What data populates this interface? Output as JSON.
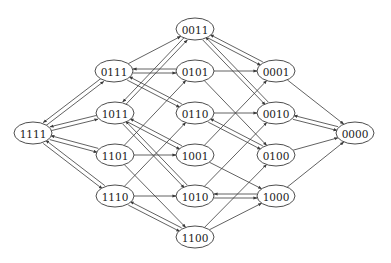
{
  "diagram": {
    "type": "directed-graph",
    "node_rx": 19,
    "node_ry": 11,
    "nodes": [
      {
        "id": "1111",
        "label": "1111",
        "x": 33,
        "y": 133
      },
      {
        "id": "0111",
        "label": "0111",
        "x": 114,
        "y": 71
      },
      {
        "id": "1011",
        "label": "1011",
        "x": 115,
        "y": 113
      },
      {
        "id": "1101",
        "label": "1101",
        "x": 115,
        "y": 155
      },
      {
        "id": "1110",
        "label": "1110",
        "x": 115,
        "y": 196
      },
      {
        "id": "0011",
        "label": "0011",
        "x": 195,
        "y": 29
      },
      {
        "id": "0101",
        "label": "0101",
        "x": 195,
        "y": 71
      },
      {
        "id": "0110",
        "label": "0110",
        "x": 195,
        "y": 113
      },
      {
        "id": "1001",
        "label": "1001",
        "x": 195,
        "y": 155
      },
      {
        "id": "1010",
        "label": "1010",
        "x": 195,
        "y": 196
      },
      {
        "id": "1100",
        "label": "1100",
        "x": 195,
        "y": 237
      },
      {
        "id": "0001",
        "label": "0001",
        "x": 276,
        "y": 71
      },
      {
        "id": "0010",
        "label": "0010",
        "x": 276,
        "y": 113
      },
      {
        "id": "0100",
        "label": "0100",
        "x": 276,
        "y": 155
      },
      {
        "id": "1000",
        "label": "1000",
        "x": 276,
        "y": 196
      },
      {
        "id": "0000",
        "label": "0000",
        "x": 355,
        "y": 133
      }
    ],
    "edges": [
      {
        "from": "1111",
        "to": "0111",
        "bidirectional": true
      },
      {
        "from": "1111",
        "to": "1011",
        "bidirectional": true
      },
      {
        "from": "1111",
        "to": "1101",
        "bidirectional": true
      },
      {
        "from": "1111",
        "to": "1110",
        "bidirectional": true
      },
      {
        "from": "0111",
        "to": "0011",
        "bidirectional": false
      },
      {
        "from": "0111",
        "to": "0101",
        "bidirectional": true
      },
      {
        "from": "0111",
        "to": "0110",
        "bidirectional": true
      },
      {
        "from": "1011",
        "to": "0011",
        "bidirectional": true
      },
      {
        "from": "1011",
        "to": "1001",
        "bidirectional": true
      },
      {
        "from": "1011",
        "to": "1010",
        "bidirectional": true
      },
      {
        "from": "1101",
        "to": "0101",
        "bidirectional": false
      },
      {
        "from": "1101",
        "to": "1001",
        "bidirectional": false
      },
      {
        "from": "1101",
        "to": "1100",
        "bidirectional": false
      },
      {
        "from": "1110",
        "to": "0110",
        "bidirectional": false
      },
      {
        "from": "1110",
        "to": "1010",
        "bidirectional": false
      },
      {
        "from": "1110",
        "to": "1100",
        "bidirectional": true
      },
      {
        "from": "0011",
        "to": "0001",
        "bidirectional": true
      },
      {
        "from": "0011",
        "to": "0010",
        "bidirectional": true
      },
      {
        "from": "0101",
        "to": "0001",
        "bidirectional": false
      },
      {
        "from": "0101",
        "to": "0100",
        "bidirectional": false
      },
      {
        "from": "0110",
        "to": "0010",
        "bidirectional": false
      },
      {
        "from": "0110",
        "to": "0100",
        "bidirectional": true
      },
      {
        "from": "1001",
        "to": "0001",
        "bidirectional": false
      },
      {
        "from": "1001",
        "to": "1000",
        "bidirectional": false
      },
      {
        "from": "1010",
        "to": "0010",
        "bidirectional": false
      },
      {
        "from": "1010",
        "to": "1000",
        "bidirectional": true
      },
      {
        "from": "1100",
        "to": "0100",
        "bidirectional": false
      },
      {
        "from": "1100",
        "to": "1000",
        "bidirectional": false
      },
      {
        "from": "0001",
        "to": "0000",
        "bidirectional": false
      },
      {
        "from": "0010",
        "to": "0000",
        "bidirectional": true
      },
      {
        "from": "0100",
        "to": "0000",
        "bidirectional": false
      },
      {
        "from": "1000",
        "to": "0000",
        "bidirectional": false
      }
    ]
  }
}
